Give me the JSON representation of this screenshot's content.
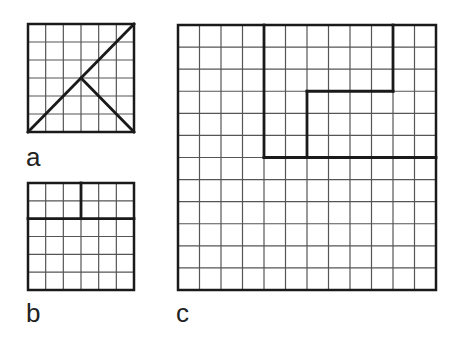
{
  "figure": {
    "panels": [
      {
        "id": "a",
        "label": "a",
        "grid": {
          "rows": 6,
          "cols": 6
        },
        "bounds": {
          "x": 28,
          "y": 24,
          "width": 106,
          "height": 108
        },
        "thick_lines": [
          {
            "from": [
              0,
              6
            ],
            "to": [
              6,
              0
            ],
            "description": "diagonal from bottom-left to top-right"
          },
          {
            "from": [
              3,
              3
            ],
            "to": [
              6,
              6
            ],
            "description": "diagonal from center to bottom-right"
          }
        ]
      },
      {
        "id": "b",
        "label": "b",
        "grid": {
          "rows": 6,
          "cols": 6
        },
        "bounds": {
          "x": 28,
          "y": 183,
          "width": 106,
          "height": 107
        },
        "thick_lines": [
          {
            "from": [
              0,
              2
            ],
            "to": [
              6,
              2
            ],
            "description": "horizontal divider at row 2"
          },
          {
            "from": [
              3,
              0
            ],
            "to": [
              3,
              2
            ],
            "description": "vertical divider at column 3 in top strip"
          }
        ]
      },
      {
        "id": "c",
        "label": "c",
        "grid": {
          "rows": 12,
          "cols": 12
        },
        "bounds": {
          "x": 178,
          "y": 25,
          "width": 258,
          "height": 265
        },
        "thick_lines": [
          {
            "from": [
              4,
              0
            ],
            "to": [
              4,
              6
            ],
            "description": "vertical at column 4 from top to row 6"
          },
          {
            "from": [
              4,
              6
            ],
            "to": [
              12,
              6
            ],
            "description": "horizontal at row 6 from column 4 to right edge"
          },
          {
            "from": [
              10,
              0
            ],
            "to": [
              10,
              3
            ],
            "description": "vertical at column 10 from top to row 3"
          },
          {
            "from": [
              6,
              3
            ],
            "to": [
              10,
              3
            ],
            "description": "horizontal at row 3 from column 6 to column 10"
          },
          {
            "from": [
              6,
              3
            ],
            "to": [
              6,
              6
            ],
            "description": "vertical at column 6 from row 3 to row 6"
          }
        ]
      }
    ],
    "colors": {
      "background": "#ffffff",
      "grid_line": "#555555",
      "thick_line": "#1a1a1a",
      "label": "#222222"
    },
    "stroke": {
      "grid": 1.2,
      "border": 2.5,
      "thick": 2.8
    }
  }
}
